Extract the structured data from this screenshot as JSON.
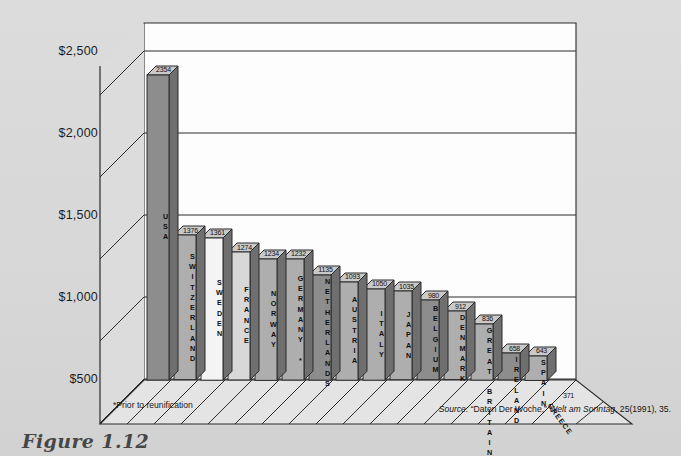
{
  "chart_data": {
    "type": "bar",
    "title": "",
    "subtitle": "",
    "xlabel": "",
    "ylabel": "",
    "ylim": [
      0,
      2700
    ],
    "grid": true,
    "legend": "none",
    "categories": [
      "USA",
      "SWITZERLAND",
      "SWEDEN",
      "FRANCE",
      "NORWAY",
      "GERMANY *",
      "NETHERLANDS",
      "AUSTRIA",
      "ITALY",
      "JAPAN",
      "BELGIUM",
      "DENMARK",
      "GREAT BRITAIN",
      "IRELAND",
      "SPAIN",
      "GREECE"
    ],
    "values": [
      2354,
      1376,
      1361,
      1274,
      1234,
      1232,
      1135,
      1093,
      1050,
      1035,
      980,
      912,
      836,
      658,
      643,
      371
    ],
    "value_labels": [
      "2354",
      "1376",
      "1361",
      "1274",
      "1234",
      "1232",
      "1135",
      "1093",
      "1050",
      "1035",
      "980",
      "912",
      "836",
      "658",
      "643",
      "371"
    ],
    "ytick_labels": [
      "$2,500",
      "$2,000",
      "$1,500",
      "$1,000",
      "$500"
    ],
    "ytick_values": [
      2500,
      2000,
      1500,
      1000,
      500
    ]
  },
  "axis": {
    "ticks": [
      {
        "label": "$2,500",
        "value": 2500
      },
      {
        "label": "$2,000",
        "value": 2000
      },
      {
        "label": "$1,500",
        "value": 1500
      },
      {
        "label": "$1,000",
        "value": 1000
      },
      {
        "label": "$500",
        "value": 500
      }
    ]
  },
  "bars": [
    {
      "name": "USA",
      "value": 2354,
      "label": "2354",
      "shade": "dark"
    },
    {
      "name": "SWITZERLAND",
      "value": 1376,
      "label": "1376",
      "shade": "mid"
    },
    {
      "name": "SWEDEN",
      "value": 1361,
      "label": "1361",
      "shade": "light"
    },
    {
      "name": "FRANCE",
      "value": 1274,
      "label": "1274",
      "shade": "pale"
    },
    {
      "name": "NORWAY",
      "value": 1234,
      "label": "1234",
      "shade": "mid"
    },
    {
      "name": "GERMANY *",
      "value": 1232,
      "label": "1232",
      "shade": "mid"
    },
    {
      "name": "NETHERLANDS",
      "value": 1135,
      "label": "1135",
      "shade": "dark"
    },
    {
      "name": "AUSTRIA",
      "value": 1093,
      "label": "1093",
      "shade": "mid"
    },
    {
      "name": "ITALY",
      "value": 1050,
      "label": "1050",
      "shade": "mid"
    },
    {
      "name": "JAPAN",
      "value": 1035,
      "label": "1035",
      "shade": "mid"
    },
    {
      "name": "BELGIUM",
      "value": 980,
      "label": "980",
      "shade": "dark"
    },
    {
      "name": "DENMARK",
      "value": 912,
      "label": "912",
      "shade": "mid"
    },
    {
      "name": "GREAT BRITAIN",
      "value": 836,
      "label": "836",
      "shade": "mid"
    },
    {
      "name": "IRELAND",
      "value": 658,
      "label": "658",
      "shade": "dark"
    },
    {
      "name": "SPAIN",
      "value": 643,
      "label": "643",
      "shade": "mid"
    },
    {
      "name": "GREECE",
      "value": 371,
      "label": "371",
      "shade": "dark"
    }
  ],
  "notes": {
    "footnote": "*Prior to reunification",
    "source_lead": "Source:",
    "source_quote": "“Daten Der Woche,”",
    "source_italic": "Welt am Sonntag",
    "source_tail": ", 25(1991), 35."
  },
  "caption": {
    "number": "Figure 1.12",
    "text": ""
  },
  "colors": {
    "page_background": "#d9d9d9",
    "plot_background": "#fdfdfd",
    "outline": "#2b2b2b",
    "bar_dark": "#8d8d8d",
    "bar_mid": "#aeaeae",
    "bar_light": "#f4f4f4",
    "bar_pale": "#d8d8d8",
    "bar_top": "#c9c9c9",
    "bar_side": "#6f6f6f",
    "floor": "#e4e4e4"
  }
}
